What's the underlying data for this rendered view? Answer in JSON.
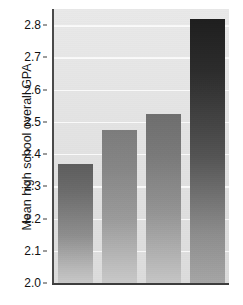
{
  "chart_data": {
    "type": "bar",
    "title": "",
    "subtitle": "",
    "xlabel": "",
    "ylabel": "Mean high school overall GPA",
    "categories": [
      "",
      "",
      "",
      ""
    ],
    "values": [
      2.37,
      2.475,
      2.525,
      2.82
    ],
    "ylim": [
      2.0,
      2.85
    ],
    "ytick_labels": [
      "2.8",
      "2.7",
      "2.6",
      "2.5",
      "2.4",
      "2.3",
      "2.2",
      "2.1",
      "2.0"
    ],
    "ytick_values": [
      2.8,
      2.7,
      2.6,
      2.5,
      2.4,
      2.3,
      2.2,
      2.1,
      2.0
    ],
    "xtick_labels": [],
    "grid": "horizontal",
    "legend": "none",
    "annotations": [],
    "series": [
      {
        "name": "Mean high school overall GPA",
        "values": [
          2.37,
          2.475,
          2.525,
          2.82
        ]
      }
    ],
    "bar_colors": [
      "#6b6b6b",
      "#868686",
      "#7a7a7a",
      "#2c2c2c"
    ],
    "plot_background": "#e3e3e3",
    "gridline_color": "#fbfbfb",
    "axis_color": "#3d3d3d"
  },
  "axis": {
    "y_title": "Mean high school overall GPA"
  }
}
